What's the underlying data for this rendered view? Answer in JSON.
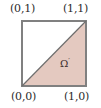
{
  "figure": {
    "colors": {
      "background": "#ffffff",
      "square_stroke": "#808080",
      "diagonal_stroke": "#6e6e6e",
      "triangle_fill": "#e4c9c0",
      "label_text": "#2b2b2b",
      "region_label_text": "#3a2b2b"
    },
    "square": {
      "name": "unit-square",
      "x": 22,
      "y": 21,
      "width": 64,
      "height": 65,
      "stroke_width": 1.3
    },
    "diagonal": {
      "name": "diagonal-line",
      "from": [
        22,
        86
      ],
      "to": [
        86,
        21
      ],
      "stroke_width": 1.2
    },
    "triangle": {
      "name": "shaded-triangle",
      "points": "22,86 86,86 86,21",
      "description": "lower-right half of the unit square, shaded"
    },
    "corner_labels": [
      {
        "name": "corner-label-top-left",
        "text": "(0,1)",
        "position": "top-left"
      },
      {
        "name": "corner-label-top-right",
        "text": "(1,1)",
        "position": "top-right"
      },
      {
        "name": "corner-label-bottom-left",
        "text": "(0,0)",
        "position": "bottom-left"
      },
      {
        "name": "corner-label-bottom-right",
        "text": "(1,0)",
        "position": "bottom-right"
      }
    ],
    "region_label": {
      "name": "omega-prime-label",
      "symbol": "Ω",
      "prime": "′"
    }
  }
}
